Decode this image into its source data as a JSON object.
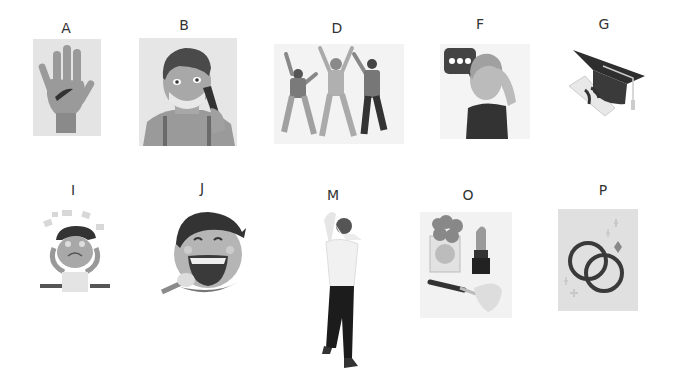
{
  "items": [
    {
      "label": "A",
      "description": "injured palm with cut"
    },
    {
      "label": "B",
      "description": "man shaving face"
    },
    {
      "label": "D",
      "description": "three people dancing"
    },
    {
      "label": "F",
      "description": "woman with speech bubble scratching head"
    },
    {
      "label": "G",
      "description": "graduation cap and diploma"
    },
    {
      "label": "I",
      "description": "stressed person at desk"
    },
    {
      "label": "J",
      "description": "boy eating corn laughing"
    },
    {
      "label": "M",
      "description": "man holding head from behind"
    },
    {
      "label": "O",
      "description": "perfume, lipstick and makeup brush"
    },
    {
      "label": "P",
      "description": "wedding rings"
    }
  ]
}
